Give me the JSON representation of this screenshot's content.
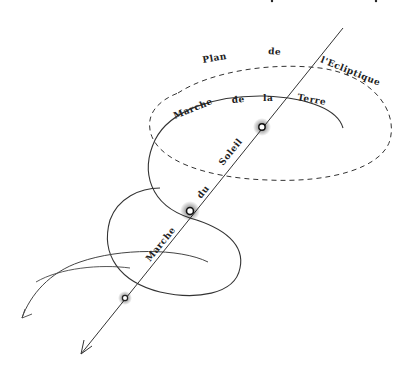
{
  "diagram": {
    "labels": {
      "plane_word1": "Plan",
      "plane_word2": "de",
      "plane_word3": "l'Ecliptique",
      "earth_word1": "Marche",
      "earth_word2": "de",
      "earth_word3": "la",
      "earth_word4": "Terre",
      "sun_word1": "Marche",
      "sun_word2": "du",
      "sun_word3": "Soleil"
    },
    "elements": {
      "ecliptic_plane": "dashed ellipse",
      "earth_path": "helical spiral around sun axis",
      "sun_axis": "straight line with arrow",
      "sun_positions": 3
    },
    "colors": {
      "ink": "#222222",
      "background": "#ffffff"
    }
  }
}
